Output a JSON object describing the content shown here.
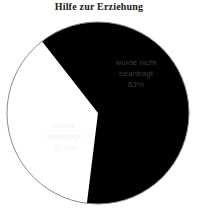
{
  "chart_data": {
    "type": "pie",
    "title": "Hilfe zur Erziehung",
    "categories": [
      "wurde nicht beantragt",
      "wurde beantragt"
    ],
    "values": [
      63,
      37.1
    ],
    "value_labels": [
      "63%",
      "37,1%"
    ],
    "colors": [
      "#ffffff",
      "#000000"
    ],
    "legend": "none",
    "outline_color": "#8c8c8c",
    "slices": [
      {
        "name": "wurde nicht beantragt",
        "label_line1": "wurde nicht",
        "label_line2": "beantragt",
        "value_label": "63%",
        "value": 63,
        "fill": "#ffffff",
        "text_color": "#3b3b3b",
        "start_angle_deg": 187,
        "end_angle_deg": 322
      },
      {
        "name": "wurde beantragt",
        "label_line1": "wurde",
        "label_line2": "beantragt",
        "value_label": "37,1%",
        "value": 37.1,
        "fill": "#000000",
        "text_color": "#f2f2f2",
        "start_angle_deg": 322,
        "end_angle_deg": 187
      }
    ],
    "geometry": {
      "center_x": 98,
      "center_y": 113,
      "radius": 91
    }
  }
}
